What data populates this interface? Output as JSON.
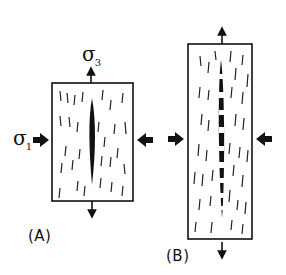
{
  "figure": {
    "panels": [
      {
        "id": "A",
        "label": "(A)",
        "description": "Single lens-shaped vein in a block with vertical cleavage marks; compressed horizontally by sigma 1, extended vertically along sigma 3"
      },
      {
        "id": "B",
        "label": "(B)",
        "description": "Elongated block with a long thin vein segmented by white bars (crack-seal / boudinaged), same stress orientations"
      }
    ],
    "stress_labels": {
      "sigma1": {
        "symbol": "σ",
        "subscript": "1"
      },
      "sigma3": {
        "symbol": "σ",
        "subscript": "3"
      }
    },
    "colors": {
      "ink": "#111111",
      "background": "#ffffff"
    }
  }
}
